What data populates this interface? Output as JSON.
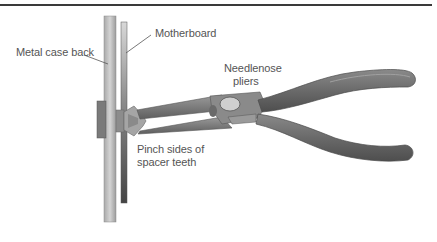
{
  "figure": {
    "labels": {
      "metal_case_back": "Metal case back",
      "motherboard": "Motherboard",
      "needlenose_pliers_line1": "Needlenose",
      "needlenose_pliers_line2": "pliers",
      "pinch_line1": "Pinch sides of",
      "pinch_line2": "spacer teeth"
    },
    "colors": {
      "rule": "#3a3a3a",
      "case_back": "#c4c4c4",
      "motherboard": "#5a5a5a",
      "pliers_jaw": "#7d7d7d",
      "pliers_handle": "#6a6a6a",
      "label_text": "#555555"
    }
  }
}
